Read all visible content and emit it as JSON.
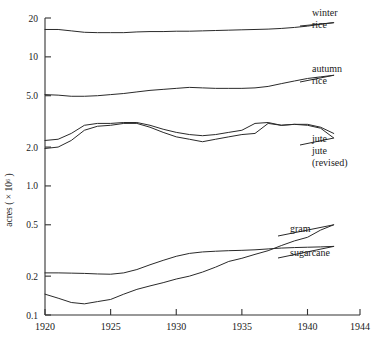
{
  "chart_data": {
    "type": "line",
    "title": "",
    "xlabel": "",
    "ylabel": "acres ( × 10⁶ )",
    "yscale": "log",
    "ylim": [
      0.1,
      20
    ],
    "xlim": [
      1920,
      1944
    ],
    "grid": false,
    "legend_position": "right-inline-labels",
    "ytick_labels": [
      "20",
      "10",
      "5.0",
      "2.0",
      "1.0",
      "0.5",
      "0.2",
      "0.1"
    ],
    "ytick_values": [
      20,
      10,
      5.0,
      2.0,
      1.0,
      0.5,
      0.2,
      0.1
    ],
    "xtick_labels": [
      "1920",
      "1925",
      "1930",
      "1935",
      "1940",
      "1944"
    ],
    "xtick_values": [
      1920,
      1925,
      1930,
      1935,
      1940,
      1944
    ],
    "series": [
      {
        "name": "winter rice",
        "label": "winter\nrice",
        "label_line1": "winter",
        "label_line2": "rice",
        "x": [
          1920,
          1921,
          1922,
          1923,
          1924,
          1925,
          1926,
          1927,
          1928,
          1929,
          1930,
          1931,
          1932,
          1933,
          1934,
          1935,
          1936,
          1937,
          1938,
          1939,
          1940,
          1941,
          1942
        ],
        "values": [
          16.3,
          16.3,
          15.9,
          15.5,
          15.4,
          15.4,
          15.4,
          15.6,
          15.7,
          15.7,
          15.8,
          15.8,
          15.9,
          16.0,
          16.1,
          16.2,
          16.3,
          16.4,
          16.6,
          16.9,
          17.3,
          17.9,
          18.4
        ]
      },
      {
        "name": "autumn rice",
        "label": "autumn\nrice",
        "label_line1": "autumn",
        "label_line2": "rice",
        "x": [
          1920,
          1921,
          1922,
          1923,
          1924,
          1925,
          1926,
          1927,
          1928,
          1929,
          1930,
          1931,
          1932,
          1933,
          1934,
          1935,
          1936,
          1937,
          1938,
          1939,
          1940,
          1941,
          1942
        ],
        "values": [
          5.1,
          5.05,
          4.95,
          4.95,
          5.0,
          5.1,
          5.2,
          5.35,
          5.5,
          5.6,
          5.7,
          5.8,
          5.75,
          5.7,
          5.7,
          5.7,
          5.75,
          5.9,
          6.2,
          6.5,
          6.8,
          7.0,
          7.2
        ]
      },
      {
        "name": "jute",
        "label": "jute",
        "x": [
          1920,
          1921,
          1922,
          1923,
          1924,
          1925,
          1926,
          1927,
          1928,
          1929,
          1930,
          1931,
          1932,
          1933,
          1934,
          1935,
          1936,
          1937,
          1938,
          1939,
          1940,
          1941,
          1942
        ],
        "values": [
          2.25,
          2.3,
          2.55,
          2.95,
          3.05,
          3.05,
          3.1,
          3.1,
          2.95,
          2.75,
          2.6,
          2.5,
          2.45,
          2.5,
          2.6,
          2.7,
          3.05,
          3.1,
          2.95,
          3.0,
          2.95,
          2.8,
          2.35
        ]
      },
      {
        "name": "jute (revised)",
        "label": "jute\n(revised)",
        "label_line1": "jute",
        "label_line2": "(revised)",
        "x": [
          1920,
          1921,
          1922,
          1923,
          1924,
          1925,
          1926,
          1927,
          1928,
          1929,
          1930,
          1931,
          1932,
          1933,
          1934,
          1935,
          1936,
          1937,
          1938,
          1939,
          1940,
          1941,
          1942
        ],
        "values": [
          1.95,
          2.0,
          2.25,
          2.7,
          2.9,
          2.95,
          3.05,
          3.05,
          2.85,
          2.6,
          2.4,
          2.3,
          2.2,
          2.3,
          2.4,
          2.5,
          2.55,
          3.05,
          2.95,
          3.0,
          3.0,
          2.85,
          2.55
        ]
      },
      {
        "name": "gram",
        "label": "gram",
        "x": [
          1920,
          1921,
          1922,
          1923,
          1924,
          1925,
          1926,
          1927,
          1928,
          1929,
          1930,
          1931,
          1932,
          1933,
          1934,
          1935,
          1936,
          1937,
          1938,
          1939,
          1940,
          1941,
          1942
        ],
        "values": [
          0.145,
          0.135,
          0.125,
          0.122,
          0.127,
          0.132,
          0.145,
          0.158,
          0.168,
          0.178,
          0.19,
          0.2,
          0.215,
          0.235,
          0.26,
          0.275,
          0.295,
          0.315,
          0.345,
          0.375,
          0.4,
          0.455,
          0.5
        ]
      },
      {
        "name": "sugarcane",
        "label": "sugarcane",
        "x": [
          1920,
          1921,
          1922,
          1923,
          1924,
          1925,
          1926,
          1927,
          1928,
          1929,
          1930,
          1931,
          1932,
          1933,
          1934,
          1935,
          1936,
          1937,
          1938,
          1939,
          1940,
          1941,
          1942
        ],
        "values": [
          0.212,
          0.212,
          0.211,
          0.21,
          0.208,
          0.207,
          0.212,
          0.225,
          0.245,
          0.265,
          0.285,
          0.3,
          0.308,
          0.312,
          0.315,
          0.317,
          0.32,
          0.325,
          0.33,
          0.333,
          0.335,
          0.337,
          0.34
        ]
      }
    ]
  }
}
